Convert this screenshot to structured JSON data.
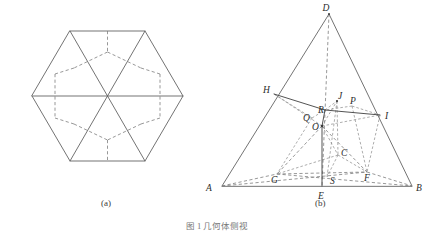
{
  "figure": {
    "caption_bottom": "图 1  几何体侧视",
    "panels": [
      {
        "id": "a",
        "label": "(a)",
        "title": "regular-hexagon-unfolded-net",
        "description": "Regular hexagon divided by solid diagonals into six triangles with an inner dashed hexagonal star pattern"
      },
      {
        "id": "b",
        "label": "(b)",
        "title": "triangle-solid-projection",
        "description": "Large triangle A-D-B with interior dashed construction lines and labelled points"
      }
    ]
  },
  "panel_a": {
    "label": "(a)",
    "hexagon_vertices": [
      {
        "name": "top-left",
        "x": 70,
        "y": 31
      },
      {
        "name": "top-right",
        "x": 145,
        "y": 31
      },
      {
        "name": "right",
        "x": 183,
        "y": 96
      },
      {
        "name": "bottom-right",
        "x": 145,
        "y": 161
      },
      {
        "name": "bottom-left",
        "x": 70,
        "y": 161
      },
      {
        "name": "left",
        "x": 32,
        "y": 96
      }
    ],
    "center": {
      "x": 107.5,
      "y": 96
    },
    "solid_diagonals": [
      {
        "from": "top-left",
        "to": "bottom-right"
      },
      {
        "from": "top-right",
        "to": "bottom-left"
      },
      {
        "from": "left",
        "to": "right"
      }
    ],
    "inner_dashed_points": [
      {
        "name": "p-top",
        "x": 107.5,
        "y": 31
      },
      {
        "name": "p-top-in",
        "x": 107.5,
        "y": 52
      },
      {
        "name": "p-ul",
        "x": 74,
        "y": 68
      },
      {
        "name": "p-ur",
        "x": 141,
        "y": 68
      },
      {
        "name": "p-l-up",
        "x": 55,
        "y": 74
      },
      {
        "name": "p-r-up",
        "x": 160,
        "y": 74
      },
      {
        "name": "p-l-mid",
        "x": 55,
        "y": 118
      },
      {
        "name": "p-r-mid",
        "x": 160,
        "y": 118
      },
      {
        "name": "p-ll",
        "x": 74,
        "y": 124
      },
      {
        "name": "p-lr",
        "x": 141,
        "y": 124
      },
      {
        "name": "p-bot-in",
        "x": 107.5,
        "y": 140
      },
      {
        "name": "p-bot",
        "x": 107.5,
        "y": 161
      }
    ]
  },
  "panel_b": {
    "label": "(b)",
    "points": [
      {
        "name": "D",
        "label": "D",
        "x": 329,
        "y": 14,
        "lx": 326,
        "ly": 10
      },
      {
        "name": "A",
        "label": "A",
        "x": 222,
        "y": 186,
        "lx": 206,
        "ly": 190
      },
      {
        "name": "B",
        "label": "B",
        "x": 412,
        "y": 186,
        "lx": 417,
        "ly": 190
      },
      {
        "name": "E",
        "label": "E",
        "x": 322,
        "y": 186,
        "lx": 318,
        "ly": 197
      },
      {
        "name": "H",
        "label": "H",
        "x": 274,
        "y": 94,
        "lx": 265,
        "ly": 92
      },
      {
        "name": "I",
        "label": "I",
        "x": 380,
        "y": 115,
        "lx": 385,
        "ly": 117
      },
      {
        "name": "J",
        "label": "J",
        "x": 337,
        "y": 101,
        "lx": 339,
        "ly": 97
      },
      {
        "name": "P",
        "label": "P",
        "x": 352,
        "y": 106,
        "lx": 352,
        "ly": 103
      },
      {
        "name": "R",
        "label": "R",
        "x": 325,
        "y": 110,
        "lx": 320,
        "ly": 110
      },
      {
        "name": "Q",
        "label": "Q",
        "x": 312,
        "y": 118,
        "lx": 305,
        "ly": 118
      },
      {
        "name": "O",
        "label": "O",
        "x": 322,
        "y": 126,
        "lx": 314,
        "ly": 127
      },
      {
        "name": "C",
        "label": "C",
        "x": 338,
        "y": 155,
        "lx": 340,
        "ly": 154
      },
      {
        "name": "G",
        "label": "G",
        "x": 277,
        "y": 174,
        "lx": 273,
        "ly": 180
      },
      {
        "name": "S",
        "label": "S",
        "x": 327,
        "y": 177,
        "lx": 331,
        "ly": 182
      },
      {
        "name": "F",
        "label": "F",
        "x": 367,
        "y": 172,
        "lx": 367,
        "ly": 180
      }
    ],
    "solid_edges": [
      {
        "from": "A",
        "to": "D"
      },
      {
        "from": "D",
        "to": "B"
      },
      {
        "from": "A",
        "to": "B"
      }
    ],
    "solid_inner": [
      {
        "from": "H",
        "to": "R"
      },
      {
        "from": "R",
        "to": "I"
      },
      {
        "from": "R",
        "to": "O"
      },
      {
        "from": "O",
        "to": "E"
      }
    ],
    "dashed_lines": [
      {
        "from": "D",
        "to": "E"
      },
      {
        "from": "A",
        "to": "G"
      },
      {
        "from": "G",
        "to": "F"
      },
      {
        "from": "F",
        "to": "B"
      },
      {
        "from": "A",
        "to": "F"
      },
      {
        "from": "G",
        "to": "B"
      },
      {
        "from": "O",
        "to": "G"
      },
      {
        "from": "O",
        "to": "F"
      },
      {
        "from": "O",
        "to": "C"
      },
      {
        "from": "O",
        "to": "S"
      },
      {
        "from": "O",
        "to": "I"
      },
      {
        "from": "O",
        "to": "H"
      },
      {
        "from": "O",
        "to": "J"
      },
      {
        "from": "Q",
        "to": "G"
      },
      {
        "from": "Q",
        "to": "H"
      },
      {
        "from": "Q",
        "to": "R"
      },
      {
        "from": "J",
        "to": "C"
      },
      {
        "from": "J",
        "to": "S"
      },
      {
        "from": "P",
        "to": "F"
      },
      {
        "from": "P",
        "to": "I"
      },
      {
        "from": "P",
        "to": "R"
      },
      {
        "from": "C",
        "to": "F"
      },
      {
        "from": "C",
        "to": "G"
      },
      {
        "from": "C",
        "to": "S"
      },
      {
        "from": "I",
        "to": "F"
      },
      {
        "from": "R",
        "to": "J"
      }
    ]
  }
}
